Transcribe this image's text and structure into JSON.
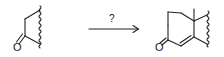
{
  "diagram": {
    "type": "chemical-reaction-scheme",
    "reactant": {
      "label": "cyclic ketone fragment",
      "atoms": [
        {
          "symbol": "O"
        }
      ]
    },
    "arrow": {
      "reagent_label": "?"
    },
    "product": {
      "label": "annulated bicyclic enone with angular methyl",
      "atoms": [
        {
          "symbol": "O"
        }
      ]
    },
    "colors": {
      "stroke": "#222222",
      "background": "#ffffff"
    }
  }
}
